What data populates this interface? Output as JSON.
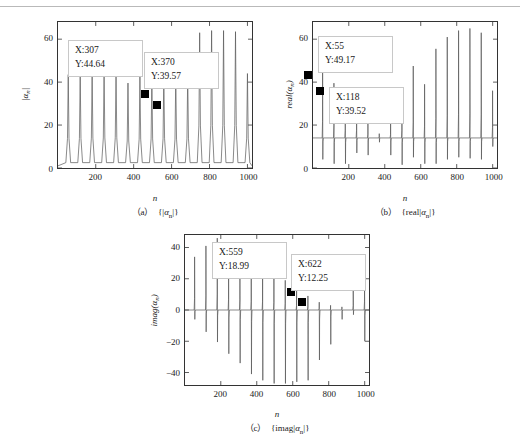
{
  "figure": {
    "background": "#ffffff",
    "line_color": "#555555",
    "axis_color": "#333333",
    "marker_color": "#000000"
  },
  "panels": [
    {
      "id": "a",
      "caption": "（a） {|αn|}",
      "caption_label": "（a）",
      "caption_expr": "{|αn|}",
      "xlabel": "n",
      "ylabel": "|αn|",
      "yticks": [
        "0",
        "20",
        "40",
        "60"
      ],
      "xticks": [
        "200",
        "400",
        "600",
        "800",
        "1000"
      ],
      "datatips": [
        {
          "x_label": "X:307",
          "y_label": "Y:44.64",
          "x": 307,
          "y": 44.64
        },
        {
          "x_label": "X:370",
          "y_label": "Y:39.57",
          "x": 370,
          "y": 39.57
        }
      ]
    },
    {
      "id": "b",
      "caption": "（b） {real|αn|}",
      "caption_label": "（b）",
      "caption_expr": "{real|αn|}",
      "xlabel": "n",
      "ylabel": "real(αn)",
      "yticks": [
        "0",
        "20",
        "40",
        "60"
      ],
      "xticks": [
        "200",
        "400",
        "600",
        "800",
        "1000"
      ],
      "datatips": [
        {
          "x_label": "X:55",
          "y_label": "Y:49.17",
          "x": 55,
          "y": 49.17
        },
        {
          "x_label": "X:118",
          "y_label": "Y:39.52",
          "x": 118,
          "y": 39.52
        }
      ]
    },
    {
      "id": "c",
      "caption": "（c） {imag|αn|}",
      "caption_label": "（c）",
      "caption_expr": "{imag|αn|}",
      "xlabel": "n",
      "ylabel": "imag(αn)",
      "yticks": [
        "-40",
        "-20",
        "0",
        "20",
        "40"
      ],
      "xticks": [
        "200",
        "400",
        "600",
        "800",
        "1000"
      ],
      "datatips": [
        {
          "x_label": "X:559",
          "y_label": "Y:18.99",
          "x": 559,
          "y": 18.99
        },
        {
          "x_label": "X:622",
          "y_label": "Y:12.25",
          "x": 622,
          "y": 12.25
        }
      ]
    }
  ],
  "chart_data": [
    {
      "type": "line",
      "panel": "a",
      "title": "（a） {|αn|}",
      "xlabel": "n",
      "ylabel": "|αn|",
      "xlim": [
        1,
        1024
      ],
      "ylim": [
        0,
        68
      ],
      "yticks": [
        0,
        20,
        40,
        60
      ],
      "xticks": [
        200,
        400,
        600,
        800,
        1000
      ],
      "grid": false,
      "description": "Magnitude of alpha_n: baseline near 1 with regularly spaced narrow positive spikes roughly every 63 samples; spike heights grow from about 43 to about 64 across the record.",
      "spike_period": 63,
      "baseline": 1.0,
      "spikes": [
        {
          "x": 55,
          "y": 43.5
        },
        {
          "x": 118,
          "y": 43.5
        },
        {
          "x": 181,
          "y": 44.0
        },
        {
          "x": 244,
          "y": 44.3
        },
        {
          "x": 307,
          "y": 44.64
        },
        {
          "x": 370,
          "y": 39.57
        },
        {
          "x": 433,
          "y": 42.5
        },
        {
          "x": 496,
          "y": 42.8
        },
        {
          "x": 559,
          "y": 43.0
        },
        {
          "x": 622,
          "y": 42.5
        },
        {
          "x": 685,
          "y": 43.0
        },
        {
          "x": 748,
          "y": 63.0
        },
        {
          "x": 811,
          "y": 64.0
        },
        {
          "x": 874,
          "y": 64.0
        },
        {
          "x": 937,
          "y": 63.5
        },
        {
          "x": 1000,
          "y": 44.0
        }
      ]
    },
    {
      "type": "line",
      "panel": "b",
      "title": "（b） {real|αn|}",
      "xlabel": "n",
      "ylabel": "real(αn)",
      "xlim": [
        1,
        1024
      ],
      "ylim": [
        0,
        68
      ],
      "yticks": [
        0,
        20,
        40,
        60
      ],
      "xticks": [
        200,
        400,
        600,
        800,
        1000
      ],
      "grid": false,
      "description": "Real part of alpha_n: plateau baseline near 14 with bipolar spikes at the same period; the upward spikes start near 49 and dip to about 17 mid-record before rising to about 65 at the end, each paired with a downward excursion toward 2-7.",
      "spike_period": 63,
      "baseline": 14.0,
      "spikes": [
        {
          "x": 55,
          "up": 49.17,
          "down": 4.0
        },
        {
          "x": 118,
          "up": 39.52,
          "down": 2.0
        },
        {
          "x": 181,
          "up": 30.0,
          "down": 2.0
        },
        {
          "x": 244,
          "up": 30.0,
          "down": 7.0
        },
        {
          "x": 307,
          "up": 22.0,
          "down": 6.0
        },
        {
          "x": 370,
          "up": 16.0,
          "down": 12.0
        },
        {
          "x": 433,
          "up": 21.0,
          "down": 6.0
        },
        {
          "x": 496,
          "up": 30.5,
          "down": 1.5
        },
        {
          "x": 559,
          "up": 47.5,
          "down": 5.0
        },
        {
          "x": 622,
          "up": 39.0,
          "down": 2.0
        },
        {
          "x": 685,
          "up": 55.5,
          "down": 2.0
        },
        {
          "x": 748,
          "up": 61.0,
          "down": 4.0
        },
        {
          "x": 811,
          "up": 64.0,
          "down": 5.0
        },
        {
          "x": 874,
          "up": 65.0,
          "down": 4.5
        },
        {
          "x": 937,
          "up": 63.0,
          "down": 4.0
        },
        {
          "x": 1000,
          "up": 36.0,
          "down": 10.0
        }
      ]
    },
    {
      "type": "line",
      "panel": "c",
      "title": "（c） {imag|αn|}",
      "xlabel": "n",
      "ylabel": "imag(αn)",
      "xlim": [
        1,
        1024
      ],
      "ylim": [
        -48,
        48
      ],
      "yticks": [
        -40,
        -20,
        0,
        20,
        40
      ],
      "xticks": [
        200,
        400,
        600,
        800,
        1000
      ],
      "grid": false,
      "description": "Imaginary part of alpha_n: baseline near 0 with bipolar spike pairs; positive peaks decay from about 34 to near 2 while the paired negative excursions deepen from about -6 to below -45 near n=500-700, then both shrink toward the end with a final spike near n=1000.",
      "spike_period": 63,
      "baseline": 0.0,
      "spikes": [
        {
          "x": 55,
          "up": 34.0,
          "down": -6.0
        },
        {
          "x": 118,
          "up": 41.0,
          "down": -14.0
        },
        {
          "x": 181,
          "up": 46.0,
          "down": -20.5
        },
        {
          "x": 244,
          "up": 30.0,
          "down": -28.0
        },
        {
          "x": 307,
          "up": 29.5,
          "down": -34.0
        },
        {
          "x": 370,
          "up": 25.0,
          "down": -41.0
        },
        {
          "x": 433,
          "up": 24.0,
          "down": -45.0
        },
        {
          "x": 496,
          "up": 22.0,
          "down": -47.0
        },
        {
          "x": 559,
          "up": 18.99,
          "down": -47.0
        },
        {
          "x": 622,
          "up": 12.25,
          "down": -46.0
        },
        {
          "x": 685,
          "up": 9.0,
          "down": -45.0
        },
        {
          "x": 748,
          "up": 5.0,
          "down": -32.0
        },
        {
          "x": 811,
          "up": 3.0,
          "down": -22.0
        },
        {
          "x": 874,
          "up": 2.0,
          "down": -6.0
        },
        {
          "x": 937,
          "up": 13.0,
          "down": -3.0
        },
        {
          "x": 1000,
          "up": 24.0,
          "down": -20.0
        }
      ]
    }
  ]
}
